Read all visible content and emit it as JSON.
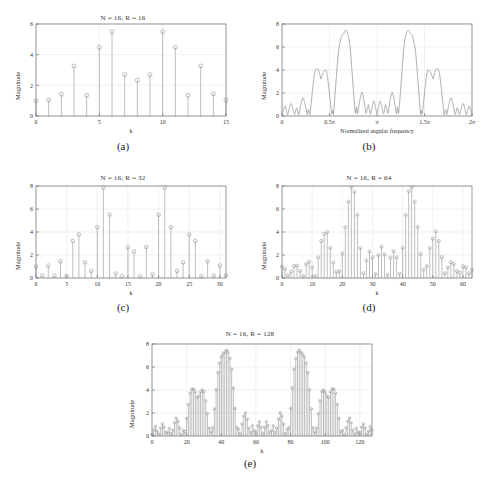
{
  "figure": {
    "panels": [
      {
        "id": "a",
        "caption": "(a)",
        "chart_data": {
          "type": "bar",
          "title": "N = 16, R = 16",
          "xlabel": "k",
          "ylabel": "Magnitude",
          "xlim": [
            0,
            15
          ],
          "ylim": [
            0,
            6
          ],
          "xticks": [
            0,
            5,
            10,
            15
          ],
          "yticks": [
            0,
            2,
            4,
            6
          ],
          "grid": true,
          "marker": "circle-stem",
          "categories": [
            0,
            1,
            2,
            3,
            4,
            5,
            6,
            7,
            8,
            9,
            10,
            11,
            12,
            13,
            14,
            15
          ],
          "values": [
            1.0,
            1.05,
            1.42,
            3.26,
            1.35,
            4.48,
            5.5,
            2.7,
            2.33,
            2.7,
            5.5,
            4.48,
            1.35,
            3.26,
            1.45,
            1.05
          ]
        }
      },
      {
        "id": "b",
        "caption": "(b)",
        "chart_data": {
          "type": "line",
          "title": "",
          "xlabel": "Normalized angular frequency",
          "ylabel": "Magnitude",
          "xlim": [
            0,
            2
          ],
          "ylim": [
            0,
            8
          ],
          "xticks": [
            0,
            0.5,
            1,
            1.5,
            2
          ],
          "xticklabels": [
            "0",
            "0.5π",
            "π",
            "1.5π",
            "2π"
          ],
          "yticks": [
            0,
            2,
            4,
            6,
            8
          ],
          "grid": true,
          "peaks": [
            {
              "x": 0.4,
              "y": 4.0
            },
            {
              "x": 0.66,
              "y": 8.0
            },
            {
              "x": 1.34,
              "y": 8.0
            },
            {
              "x": 1.6,
              "y": 4.0
            }
          ],
          "note": "DTFT magnitude envelope of the 16-point sequence"
        }
      },
      {
        "id": "c",
        "caption": "(c)",
        "chart_data": {
          "type": "bar",
          "title": "N = 16, R = 32",
          "xlabel": "k",
          "ylabel": "Magnitude",
          "xlim": [
            0,
            31
          ],
          "ylim": [
            0,
            8
          ],
          "xticks": [
            0,
            5,
            10,
            15,
            20,
            25,
            30
          ],
          "yticks": [
            0,
            2,
            4,
            6,
            8
          ],
          "grid": true,
          "marker": "circle-stem",
          "categories": [
            0,
            1,
            2,
            3,
            4,
            5,
            6,
            7,
            8,
            9,
            10,
            11,
            12,
            13,
            14,
            15,
            16,
            17,
            18,
            19,
            20,
            21,
            22,
            23,
            24,
            25,
            26,
            27,
            28,
            29,
            30,
            31
          ],
          "values": [
            1.0,
            0.22,
            1.08,
            0.2,
            1.45,
            0.18,
            3.22,
            3.78,
            1.36,
            0.62,
            4.42,
            7.85,
            5.52,
            0.4,
            0.15,
            2.68,
            2.3,
            0.15,
            2.7,
            0.32,
            5.5,
            7.85,
            4.42,
            0.62,
            1.36,
            3.78,
            3.22,
            0.18,
            1.45,
            0.2,
            1.08,
            0.22
          ]
        }
      },
      {
        "id": "d",
        "caption": "(d)",
        "chart_data": {
          "type": "bar",
          "title": "N = 16, R = 64",
          "xlabel": "k",
          "ylabel": "Magnitude",
          "xlim": [
            0,
            63
          ],
          "ylim": [
            0,
            8
          ],
          "xticks": [
            0,
            10,
            20,
            30,
            40,
            50,
            60
          ],
          "yticks": [
            0,
            2,
            4,
            6,
            8
          ],
          "grid": true,
          "marker": "circle-stem",
          "categories": [
            0,
            1,
            2,
            3,
            4,
            5,
            6,
            7,
            8,
            9,
            10,
            11,
            12,
            13,
            14,
            15,
            16,
            17,
            18,
            19,
            20,
            21,
            22,
            23,
            24,
            25,
            26,
            27,
            28,
            29,
            30,
            31,
            32,
            33,
            34,
            35,
            36,
            37,
            38,
            39,
            40,
            41,
            42,
            43,
            44,
            45,
            46,
            47,
            48,
            49,
            50,
            51,
            52,
            53,
            54,
            55,
            56,
            57,
            58,
            59,
            60,
            61,
            62,
            63
          ],
          "values": [
            1.0,
            0.78,
            0.25,
            0.55,
            1.05,
            1.08,
            0.62,
            0.18,
            1.2,
            1.4,
            0.95,
            0.2,
            1.8,
            3.22,
            3.85,
            4.0,
            2.62,
            1.35,
            0.52,
            0.6,
            2.12,
            4.42,
            6.65,
            7.9,
            7.5,
            5.5,
            2.6,
            0.42,
            1.55,
            2.3,
            1.8,
            0.35,
            2.0,
            2.72,
            2.05,
            0.28,
            1.78,
            2.32,
            1.8,
            0.38,
            2.62,
            5.5,
            7.55,
            7.9,
            6.65,
            4.45,
            2.1,
            0.72,
            1.05,
            2.6,
            3.42,
            4.05,
            3.22,
            1.82,
            0.42,
            0.92,
            1.38,
            1.22,
            0.6,
            0.45,
            1.02,
            0.92,
            0.42,
            0.72
          ]
        }
      },
      {
        "id": "e",
        "caption": "(e)",
        "chart_data": {
          "type": "bar",
          "title": "N = 16, R = 128",
          "xlabel": "k",
          "ylabel": "Magnitude",
          "xlim": [
            0,
            127
          ],
          "ylim": [
            0,
            8
          ],
          "xticks": [
            0,
            20,
            40,
            60,
            80,
            100,
            120
          ],
          "yticks": [
            0,
            2,
            4,
            6,
            8
          ],
          "grid": true,
          "marker": "circle-stem",
          "categories_count": 128,
          "peaks": [
            {
              "k": 27,
              "y": 4.0
            },
            {
              "k": 44,
              "y": 8.0
            },
            {
              "k": 84,
              "y": 8.0
            },
            {
              "k": 101,
              "y": 4.0
            }
          ],
          "note": "128-point DFT densely samples the DTFT envelope of panel (b)"
        }
      }
    ]
  }
}
